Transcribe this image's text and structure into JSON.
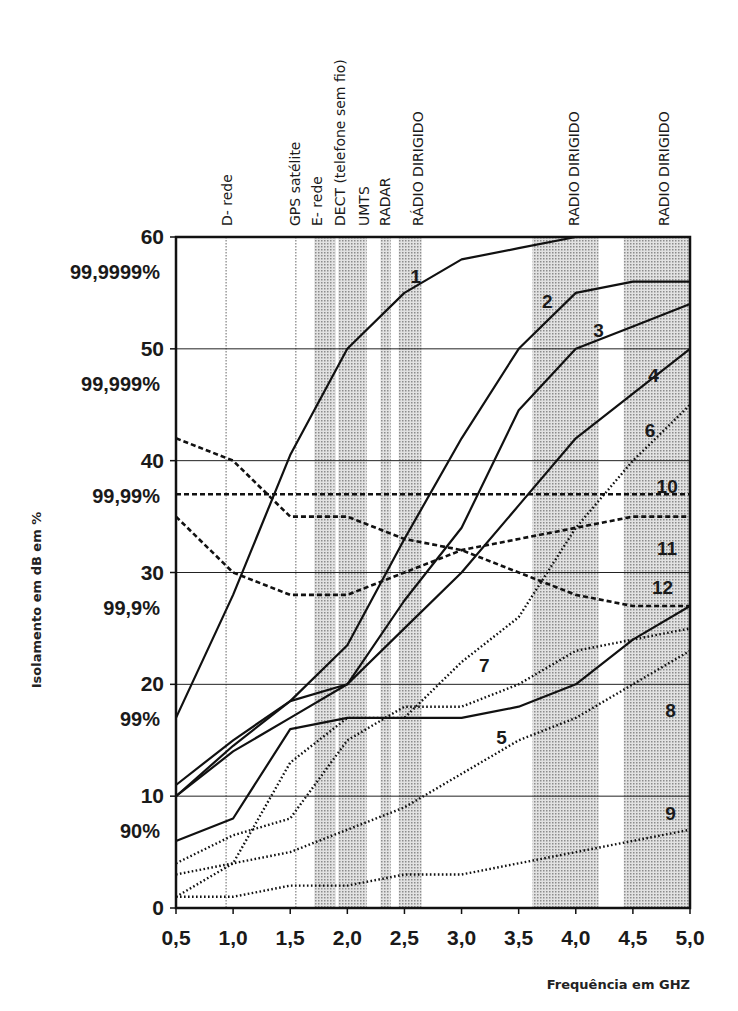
{
  "chart_data": {
    "type": "line",
    "title": "",
    "xlabel": "Frequência em GHZ",
    "ylabel": "Isolamento em dB em %",
    "xlim": [
      0.5,
      5.0
    ],
    "ylim": [
      0,
      60
    ],
    "x": [
      0.5,
      1.0,
      1.5,
      2.0,
      2.5,
      3.0,
      3.5,
      4.0,
      4.5,
      5.0
    ],
    "x_tick_labels": [
      "0,5",
      "1,0",
      "1,5",
      "2,0",
      "2,5",
      "3,0",
      "3,5",
      "4,0",
      "4,5",
      "5,0"
    ],
    "y_ticks": [
      {
        "value": 0,
        "label": "0",
        "pct": ""
      },
      {
        "value": 10,
        "label": "10",
        "pct": "90%"
      },
      {
        "value": 20,
        "label": "20",
        "pct": "99%"
      },
      {
        "value": 30,
        "label": "30",
        "pct": "99,9%"
      },
      {
        "value": 40,
        "label": "40",
        "pct": "99,99%"
      },
      {
        "value": 50,
        "label": "50",
        "pct": "99,999%"
      },
      {
        "value": 60,
        "label": "60",
        "pct": "99,9999%"
      }
    ],
    "grid": "horizontal",
    "bands": [
      {
        "label": "D- rede",
        "from": 0.93,
        "to": 0.96,
        "style": "line"
      },
      {
        "label": "GPS satélite",
        "from": 1.54,
        "to": 1.57,
        "style": "line"
      },
      {
        "label": "E- rede",
        "from": 1.71,
        "to": 1.88,
        "style": "shade"
      },
      {
        "label": "DECT (telefone sem fio)",
        "from": 1.88,
        "to": 1.9,
        "style": "shade"
      },
      {
        "label": "UMTS",
        "from": 1.92,
        "to": 2.17,
        "style": "shade"
      },
      {
        "label": "RADAR",
        "from": 2.29,
        "to": 2.38,
        "style": "shade"
      },
      {
        "label": "RÁDIO DIRIGIDO",
        "from": 2.45,
        "to": 2.65,
        "style": "shade"
      },
      {
        "label": "RADIO DIRIGIDO",
        "from": 3.62,
        "to": 4.2,
        "style": "shade"
      },
      {
        "label": "RADIO DIRIGIDO",
        "from": 4.42,
        "to": 5.0,
        "style": "shade"
      }
    ],
    "series": [
      {
        "name": "1",
        "style": "solid",
        "values": [
          17,
          28,
          40.5,
          50,
          55,
          58,
          59,
          60,
          60,
          60
        ],
        "label_at": [
          2.6,
          56.5
        ]
      },
      {
        "name": "2",
        "style": "solid",
        "values": [
          11,
          15,
          18.5,
          23.5,
          33,
          42,
          50,
          55,
          56,
          56
        ],
        "label_at": [
          3.75,
          54.3
        ]
      },
      {
        "name": "3",
        "style": "solid",
        "values": [
          10,
          14.5,
          18.5,
          20,
          27.5,
          34,
          44.5,
          50,
          52,
          54
        ],
        "label_at": [
          4.2,
          51.7
        ]
      },
      {
        "name": "4",
        "style": "solid",
        "values": [
          10,
          14,
          17,
          20,
          25,
          30,
          36,
          42,
          46,
          50
        ],
        "label_at": [
          4.68,
          47.7
        ]
      },
      {
        "name": "5",
        "style": "solid",
        "values": [
          6,
          8,
          16,
          17,
          17,
          17,
          18,
          20,
          24,
          27
        ],
        "label_at": [
          3.35,
          15.3
        ]
      },
      {
        "name": "6",
        "style": "dotted",
        "values": [
          1,
          4,
          13,
          17,
          17,
          22,
          26,
          34,
          40,
          45
        ],
        "label_at": [
          4.65,
          42.7
        ]
      },
      {
        "name": "7",
        "style": "dotted",
        "values": [
          4,
          6.5,
          8,
          15,
          18,
          18,
          20,
          23,
          24,
          25
        ],
        "label_at": [
          3.2,
          21.7
        ]
      },
      {
        "name": "8",
        "style": "dotted",
        "values": [
          3,
          4,
          5,
          7,
          9,
          12,
          15,
          17,
          20,
          23
        ],
        "label_at": [
          4.83,
          17.7
        ]
      },
      {
        "name": "9",
        "style": "dotted",
        "values": [
          1,
          1,
          2,
          2,
          3,
          3,
          4,
          5,
          6,
          7
        ],
        "label_at": [
          4.83,
          8.5
        ]
      },
      {
        "name": "10",
        "style": "dashed",
        "values": [
          37,
          37,
          37,
          37,
          37,
          37,
          37,
          37,
          37,
          37
        ],
        "label_at": [
          4.8,
          37.7
        ]
      },
      {
        "name": "11",
        "style": "dashed",
        "values": [
          35,
          30,
          28,
          28,
          30,
          32,
          33,
          34,
          35,
          35
        ],
        "label_at": [
          4.8,
          32.2
        ]
      },
      {
        "name": "12",
        "style": "dashed",
        "values": [
          42,
          40,
          35,
          35,
          33,
          32,
          30,
          28,
          27,
          27
        ],
        "label_at": [
          4.76,
          28.7
        ]
      }
    ],
    "legend": "inline curve numbers"
  },
  "axes": {
    "y_title": "Isolamento em dB em %",
    "x_title": "Frequência em GHZ"
  }
}
